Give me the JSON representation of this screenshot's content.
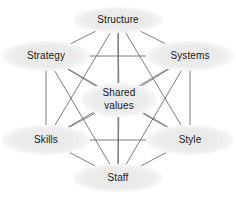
{
  "diagram": {
    "type": "network-hexagon",
    "canvas": {
      "width": 236,
      "height": 200
    },
    "style": {
      "background": "#ffffff",
      "node_fill": "#ececec",
      "node_fill_soft": "#f0f0f0",
      "label_color": "#1a1a1a",
      "link_color": "#6e6e6e",
      "link_width": 0.9,
      "font_size": 10
    },
    "nodes": [
      {
        "id": "structure",
        "label": "Structure",
        "lines": [
          "Structure"
        ],
        "cx": 118,
        "cy": 20,
        "rx": 45,
        "ry": 13
      },
      {
        "id": "systems",
        "label": "Systems",
        "lines": [
          "Systems"
        ],
        "cx": 190,
        "cy": 56,
        "rx": 44,
        "ry": 15
      },
      {
        "id": "style",
        "label": "Style",
        "lines": [
          "Style"
        ],
        "cx": 190,
        "cy": 140,
        "rx": 44,
        "ry": 15
      },
      {
        "id": "staff",
        "label": "Staff",
        "lines": [
          "Staff"
        ],
        "cx": 118,
        "cy": 178,
        "rx": 45,
        "ry": 14
      },
      {
        "id": "skills",
        "label": "Skills",
        "lines": [
          "Skills"
        ],
        "cx": 46,
        "cy": 140,
        "rx": 44,
        "ry": 15
      },
      {
        "id": "strategy",
        "label": "Strategy",
        "lines": [
          "Strategy"
        ],
        "cx": 46,
        "cy": 56,
        "rx": 44,
        "ry": 15
      },
      {
        "id": "shared-values",
        "label": "Shared values",
        "lines": [
          "Shared",
          "values"
        ],
        "cx": 119,
        "cy": 100,
        "rx": 38,
        "ry": 17
      }
    ],
    "links": [
      {
        "from": "structure",
        "to": "strategy"
      },
      {
        "from": "structure",
        "to": "systems"
      },
      {
        "from": "structure",
        "to": "skills"
      },
      {
        "from": "structure",
        "to": "style"
      },
      {
        "from": "structure",
        "to": "staff"
      },
      {
        "from": "structure",
        "to": "shared-values"
      },
      {
        "from": "systems",
        "to": "strategy"
      },
      {
        "from": "systems",
        "to": "style"
      },
      {
        "from": "systems",
        "to": "staff"
      },
      {
        "from": "systems",
        "to": "skills"
      },
      {
        "from": "systems",
        "to": "shared-values"
      },
      {
        "from": "style",
        "to": "staff"
      },
      {
        "from": "style",
        "to": "skills"
      },
      {
        "from": "style",
        "to": "strategy"
      },
      {
        "from": "style",
        "to": "shared-values"
      },
      {
        "from": "staff",
        "to": "skills"
      },
      {
        "from": "staff",
        "to": "strategy"
      },
      {
        "from": "staff",
        "to": "shared-values"
      },
      {
        "from": "skills",
        "to": "strategy"
      },
      {
        "from": "skills",
        "to": "shared-values"
      },
      {
        "from": "strategy",
        "to": "shared-values"
      }
    ]
  }
}
